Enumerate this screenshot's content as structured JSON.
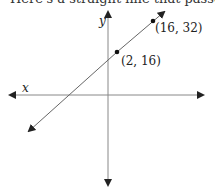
{
  "caption": "Here's a straight line that passes",
  "axes": {
    "x_label": "x",
    "y_label": "y"
  },
  "points": [
    {
      "label": "(2, 16)",
      "x": 2,
      "y": 16
    },
    {
      "label": "(16, 32)",
      "x": 16,
      "y": 32
    }
  ],
  "colors": {
    "axis": "#777777",
    "line": "#666666",
    "point": "#111111",
    "arrow": "#222222"
  }
}
